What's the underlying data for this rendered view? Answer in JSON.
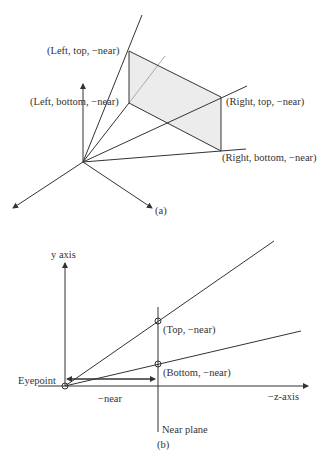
{
  "figure_a": {
    "labels": {
      "left_top": "(Left, top, −near)",
      "left_bottom": "(Left, bottom, −near)",
      "right_top": "(Right, top, −near)",
      "right_bottom": "(Right, bottom, −near)"
    },
    "caption": "(a)"
  },
  "figure_b": {
    "y_axis_label": "y axis",
    "z_axis_label": "−z-axis",
    "eyepoint_label": "Eyepoint",
    "top_label": "(Top, −near)",
    "bottom_label": "(Bottom, −near)",
    "distance_label": "−near",
    "near_plane_label": "Near plane",
    "caption": "(b)"
  },
  "colors": {
    "line": "#333333",
    "fill": "#ececec"
  }
}
